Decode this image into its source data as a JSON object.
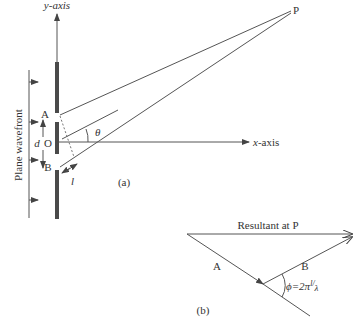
{
  "figure_a": {
    "y_axis_label": "y-axis",
    "x_axis_label": "x-axis",
    "point_p": "P",
    "slit_a": "A",
    "origin": "O",
    "slit_b": "B",
    "separation": "d",
    "angle": "θ",
    "path_difference": "l",
    "wavefront_label": "Plane wavefront",
    "caption": "(a)"
  },
  "figure_b": {
    "resultant_label": "Resultant at P",
    "vector_a": "A",
    "vector_b": "B",
    "phase_label": "ϕ=2π",
    "phase_fraction_num": "l",
    "phase_fraction_den": "λ",
    "caption": "(b)"
  }
}
